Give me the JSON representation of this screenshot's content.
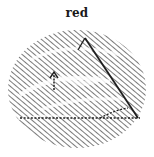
{
  "image": {
    "caption": "red",
    "subject": "hatched-oval-sketch",
    "colors": {
      "background": "#ffffff",
      "ink": "#2a2a2a",
      "hatch": "#3c3c3c",
      "highlight": "#ffffff"
    }
  }
}
